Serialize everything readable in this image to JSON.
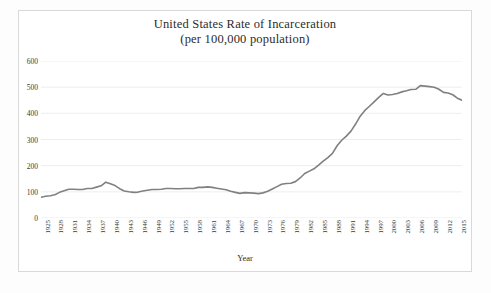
{
  "figure": {
    "title_line1": "United States Rate of Incarceration",
    "title_line2": "(per 100,000 population)",
    "xlabel": "Year",
    "frame_color": "#d9d9d9",
    "background": "#ffffff"
  },
  "chart_data": {
    "type": "line",
    "title": "United States Rate of Incarceration (per 100,000 population)",
    "xlabel": "Year",
    "ylabel": "",
    "ylim": [
      0,
      600
    ],
    "xlim": [
      1925,
      2016
    ],
    "grid": "horizontal",
    "legend": "none",
    "line_color": "#808080",
    "ytick_labels": [
      "0",
      "100",
      "200",
      "300",
      "400",
      "500",
      "600"
    ],
    "ytick_values": [
      0,
      100,
      200,
      300,
      400,
      500,
      600
    ],
    "xtick_labels": [
      "1925",
      "1928",
      "1931",
      "1934",
      "1937",
      "1940",
      "1943",
      "1946",
      "1949",
      "1952",
      "1955",
      "1958",
      "1961",
      "1964",
      "1967",
      "1970",
      "1973",
      "1976",
      "1979",
      "1982",
      "1985",
      "1988",
      "1991",
      "1994",
      "1997",
      "2000",
      "2003",
      "2006",
      "2009",
      "2012",
      "2015"
    ],
    "xtick_values": [
      1925,
      1928,
      1931,
      1934,
      1937,
      1940,
      1943,
      1946,
      1949,
      1952,
      1955,
      1958,
      1961,
      1964,
      1967,
      1970,
      1973,
      1976,
      1979,
      1982,
      1985,
      1988,
      1991,
      1994,
      1997,
      2000,
      2003,
      2006,
      2009,
      2012,
      2015
    ],
    "series": [
      {
        "name": "Rate of incarceration per 100,000 population",
        "x": [
          1925,
          1926,
          1927,
          1928,
          1929,
          1930,
          1931,
          1932,
          1933,
          1934,
          1935,
          1936,
          1937,
          1938,
          1939,
          1940,
          1941,
          1942,
          1943,
          1944,
          1945,
          1946,
          1947,
          1948,
          1949,
          1950,
          1951,
          1952,
          1953,
          1954,
          1955,
          1956,
          1957,
          1958,
          1959,
          1960,
          1961,
          1962,
          1963,
          1964,
          1965,
          1966,
          1967,
          1968,
          1969,
          1970,
          1971,
          1972,
          1973,
          1974,
          1975,
          1976,
          1977,
          1978,
          1979,
          1980,
          1981,
          1982,
          1983,
          1984,
          1985,
          1986,
          1987,
          1988,
          1989,
          1990,
          1991,
          1992,
          1993,
          1994,
          1995,
          1996,
          1997,
          1998,
          1999,
          2000,
          2001,
          2002,
          2003,
          2004,
          2005,
          2006,
          2007,
          2008,
          2009,
          2010,
          2011,
          2012,
          2013,
          2014,
          2015,
          2016
        ],
        "values": [
          79,
          83,
          85,
          89,
          98,
          104,
          110,
          110,
          109,
          109,
          113,
          113,
          118,
          123,
          137,
          131,
          124,
          112,
          103,
          100,
          98,
          99,
          103,
          106,
          109,
          109,
          110,
          113,
          113,
          112,
          112,
          113,
          113,
          113,
          117,
          117,
          119,
          117,
          114,
          111,
          108,
          102,
          98,
          94,
          97,
          96,
          95,
          93,
          96,
          102,
          111,
          120,
          129,
          132,
          133,
          139,
          153,
          170,
          179,
          188,
          202,
          217,
          231,
          247,
          276,
          297,
          313,
          332,
          359,
          389,
          411,
          427,
          444,
          461,
          476,
          470,
          472,
          476,
          482,
          486,
          491,
          492,
          506,
          504,
          502,
          500,
          492,
          480,
          478,
          471,
          458,
          450
        ]
      }
    ],
    "annotations": {
      "start_value": 79,
      "start_year": 1925,
      "pre_war_peak_value": 137,
      "pre_war_peak_year": 1939,
      "trough_value": 93,
      "trough_year": 1972,
      "peak_value": 506,
      "peak_year": 2007,
      "end_value": 450,
      "end_year": 2016
    }
  }
}
